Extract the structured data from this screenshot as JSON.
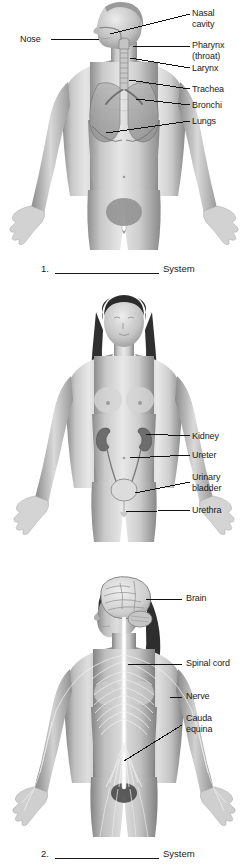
{
  "document": {
    "type": "anatomy-labeling-worksheet",
    "panel_count": 3,
    "text_color": "#1a1a1a",
    "background_color": "#ffffff",
    "answer_suffix": "System"
  },
  "panels": [
    {
      "number": "1.",
      "figure": "male-torso-respiratory-system",
      "answer_suffix": "System",
      "labels": [
        {
          "text": "Nose",
          "lines": [
            "Nose"
          ]
        },
        {
          "text": "Nasal cavity",
          "lines": [
            "Nasal",
            "cavity"
          ]
        },
        {
          "text": "Pharynx (throat)",
          "lines": [
            "Pharynx",
            "(throat)"
          ]
        },
        {
          "text": "Larynx",
          "lines": [
            "Larynx"
          ]
        },
        {
          "text": "Trachea",
          "lines": [
            "Trachea"
          ]
        },
        {
          "text": "Bronchi",
          "lines": [
            "Bronchi"
          ]
        },
        {
          "text": "Lungs",
          "lines": [
            "Lungs"
          ]
        }
      ]
    },
    {
      "number": "2.",
      "figure": "female-torso-urinary-system",
      "answer_suffix": "System",
      "labels": [
        {
          "text": "Kidney",
          "lines": [
            "Kidney"
          ]
        },
        {
          "text": "Ureter",
          "lines": [
            "Ureter"
          ]
        },
        {
          "text": "Urinary bladder",
          "lines": [
            "Urinary",
            "bladder"
          ]
        },
        {
          "text": "Urethra",
          "lines": [
            "Urethra"
          ]
        }
      ]
    },
    {
      "number": "3.",
      "figure": "female-body-nervous-system",
      "answer_suffix": "System",
      "labels": [
        {
          "text": "Brain",
          "lines": [
            "Brain"
          ]
        },
        {
          "text": "Spinal cord",
          "lines": [
            "Spinal cord"
          ]
        },
        {
          "text": "Nerve",
          "lines": [
            "Nerve"
          ]
        },
        {
          "text": "Cauda equina",
          "lines": [
            "Cauda",
            "equina"
          ]
        }
      ]
    }
  ]
}
